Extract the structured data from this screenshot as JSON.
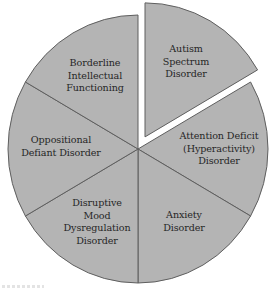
{
  "diagram": {
    "type": "exploded-pie",
    "center": [
      138,
      149
    ],
    "radius_x": 130,
    "radius_y": 134,
    "explode_offset": 14,
    "fill_color": "#b4b4b4",
    "stroke_color": "#5f5f5f",
    "divider_color": "#4a4a4a",
    "text_color": "#262626",
    "segments": [
      {
        "id": "autism-spectrum-disorder",
        "lines": [
          "Autism",
          "Spectrum",
          "Disorder"
        ],
        "start_angle": 0,
        "end_angle": 60,
        "exploded": true,
        "label_pos": [
          186,
          62
        ]
      },
      {
        "id": "attention-deficit-hyperactivity-disorder",
        "lines": [
          "Attention Deficit",
          "(Hyperactivity)",
          "Disorder"
        ],
        "start_angle": 60,
        "end_angle": 120,
        "exploded": false,
        "label_pos": [
          219,
          149
        ]
      },
      {
        "id": "anxiety-disorder",
        "lines": [
          "Anxiety",
          "Disorder"
        ],
        "start_angle": 120,
        "end_angle": 180,
        "exploded": false,
        "label_pos": [
          184,
          222
        ]
      },
      {
        "id": "disruptive-mood-dysregulation-disorder",
        "lines": [
          "Disruptive",
          "Mood",
          "Dysregulation",
          "Disorder"
        ],
        "start_angle": 180,
        "end_angle": 240,
        "exploded": false,
        "label_pos": [
          97,
          222
        ]
      },
      {
        "id": "oppositional-defiant-disorder",
        "lines": [
          "Oppositional",
          "Defiant Disorder"
        ],
        "start_angle": 240,
        "end_angle": 300,
        "exploded": false,
        "label_pos": [
          61,
          147
        ]
      },
      {
        "id": "borderline-intellectual-functioning",
        "lines": [
          "Borderline",
          "Intellectual",
          "Functioning"
        ],
        "start_angle": 300,
        "end_angle": 360,
        "exploded": false,
        "label_pos": [
          95,
          76
        ]
      }
    ]
  }
}
